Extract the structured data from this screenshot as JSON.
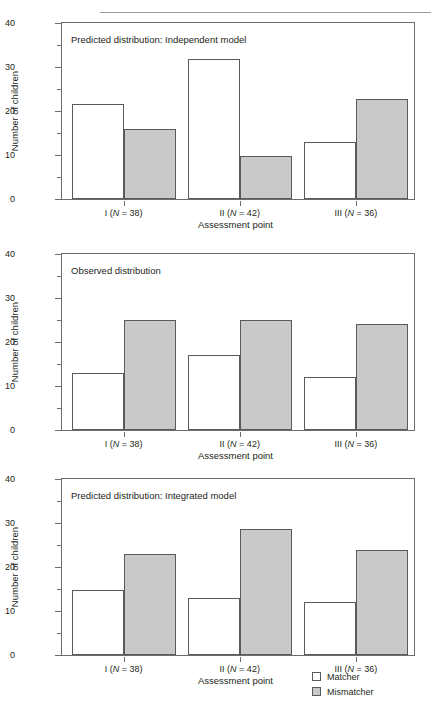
{
  "header": {
    "running_head": ""
  },
  "axes": {
    "ylabel": "Number of children",
    "xlabel": "Assessment point",
    "yticks": [
      "0",
      "10",
      "20",
      "30",
      "40"
    ],
    "xticks": [
      "I (N = 38)",
      "II (N = 42)",
      "III (N = 36)"
    ],
    "xtick_parts": [
      {
        "roman": "I",
        "n": "38"
      },
      {
        "roman": "II",
        "n": "42"
      },
      {
        "roman": "III",
        "n": "36"
      }
    ]
  },
  "legend": {
    "position": "bottom-right",
    "items": [
      {
        "label": "Matcher",
        "color": "#ffffff"
      },
      {
        "label": "Mismatcher",
        "color": "#c9c9c9"
      }
    ]
  },
  "colors": {
    "matcher_fill": "#ffffff",
    "mismatcher_fill": "#c9c9c9",
    "bar_stroke": "#5a5a5a",
    "frame": "#6d6d6d",
    "text": "#231f20"
  },
  "panels": [
    {
      "id": "panel-1",
      "title": "Predicted distribution: Independent model"
    },
    {
      "id": "panel-2",
      "title": "Observed distribution"
    },
    {
      "id": "panel-3",
      "title": "Predicted distribution: Integrated model"
    }
  ],
  "chart_data": [
    {
      "type": "bar",
      "title": "Predicted distribution: Independent model",
      "xlabel": "Assessment point",
      "ylabel": "Number of children",
      "ylim": [
        0,
        40
      ],
      "yticks": [
        0,
        10,
        20,
        30,
        40
      ],
      "grid": false,
      "legend_position": "bottom-right",
      "categories": [
        "I (N = 38)",
        "II (N = 42)",
        "III (N = 36)"
      ],
      "series": [
        {
          "name": "Matcher",
          "color": "#ffffff",
          "values": [
            21.7,
            31.8,
            13.0
          ]
        },
        {
          "name": "Mismatcher",
          "color": "#c9c9c9",
          "values": [
            16.0,
            9.8,
            22.8
          ]
        }
      ]
    },
    {
      "type": "bar",
      "title": "Observed distribution",
      "xlabel": "Assessment point",
      "ylabel": "Number of children",
      "ylim": [
        0,
        40
      ],
      "yticks": [
        0,
        10,
        20,
        30,
        40
      ],
      "grid": false,
      "legend_position": "bottom-right",
      "categories": [
        "I (N = 38)",
        "II (N = 42)",
        "III (N = 36)"
      ],
      "series": [
        {
          "name": "Matcher",
          "color": "#ffffff",
          "values": [
            13.0,
            17.0,
            12.0
          ]
        },
        {
          "name": "Mismatcher",
          "color": "#c9c9c9",
          "values": [
            25.0,
            25.0,
            24.0
          ]
        }
      ]
    },
    {
      "type": "bar",
      "title": "Predicted distribution: Integrated model",
      "xlabel": "Assessment point",
      "ylabel": "Number of children",
      "ylim": [
        0,
        40
      ],
      "yticks": [
        0,
        10,
        20,
        30,
        40
      ],
      "grid": false,
      "legend_position": "bottom-right",
      "categories": [
        "I (N = 38)",
        "II (N = 42)",
        "III (N = 36)"
      ],
      "series": [
        {
          "name": "Matcher",
          "color": "#ffffff",
          "values": [
            14.8,
            13.0,
            12.0
          ]
        },
        {
          "name": "Mismatcher",
          "color": "#c9c9c9",
          "values": [
            23.0,
            28.7,
            23.9
          ]
        }
      ]
    }
  ]
}
